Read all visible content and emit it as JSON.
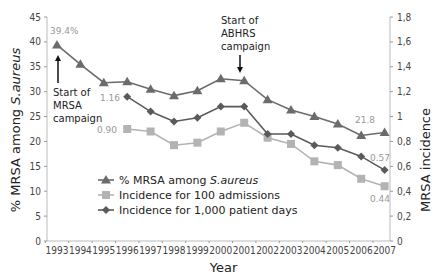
{
  "chart_data": {
    "type": "line",
    "title": "",
    "xlabel": "Year",
    "ylabel": "% MRSA among S.aureus",
    "y2label": "MRSA incidence",
    "x": [
      "1993",
      "1994",
      "1995",
      "1996",
      "1997",
      "1998",
      "1999",
      "2000",
      "2001",
      "2002",
      "2003",
      "2004",
      "2005",
      "2006",
      "2007"
    ],
    "ylim": [
      0,
      45
    ],
    "y2lim": [
      0,
      1.8
    ],
    "yticks": [
      "0",
      "5",
      "10",
      "15",
      "20",
      "25",
      "30",
      "35",
      "40",
      "45"
    ],
    "y2ticks": [
      "0",
      "0,2",
      "0,4",
      "0,6",
      "0,8",
      "1",
      "1,2",
      "1,4",
      "1,6",
      "1,8"
    ],
    "grid": false,
    "legend_position": "lower-center",
    "series": [
      {
        "name": "% MRSA among S.aureus",
        "axis": "left",
        "marker": "triangle",
        "color": "#6b6b6b",
        "values": [
          39.4,
          35.5,
          31.8,
          32.0,
          30.5,
          29.2,
          30.2,
          32.6,
          32.2,
          28.4,
          26.3,
          25.0,
          23.5,
          21.2,
          21.8
        ]
      },
      {
        "name": "Incidence for 100 admissions",
        "axis": "right",
        "marker": "square",
        "color": "#b3b3b3",
        "values": [
          null,
          null,
          null,
          0.9,
          0.88,
          0.77,
          0.79,
          0.88,
          0.95,
          0.83,
          0.78,
          0.64,
          0.61,
          0.5,
          0.44
        ]
      },
      {
        "name": "Incidence for 1,000 patient days",
        "axis": "right",
        "marker": "diamond",
        "color": "#5a5a5a",
        "values": [
          null,
          null,
          null,
          1.16,
          1.04,
          0.96,
          0.99,
          1.08,
          1.08,
          0.86,
          0.86,
          0.77,
          0.75,
          0.68,
          0.57
        ]
      }
    ],
    "annotations": [
      {
        "text": "Start of MRSA campaign",
        "x": "1993"
      },
      {
        "text": "Start of ABHRS campaign",
        "x": "2001"
      },
      {
        "text": "39.4%",
        "x": "1993",
        "series": 0
      },
      {
        "text": "21.8",
        "x": "2007",
        "series": 0
      },
      {
        "text": "1.16",
        "x": "1996",
        "series": 2
      },
      {
        "text": "0.57",
        "x": "2007",
        "series": 2
      },
      {
        "text": "0.90",
        "x": "1996",
        "series": 1
      },
      {
        "text": "0.44",
        "x": "2007",
        "series": 1
      }
    ]
  },
  "labels": {
    "xlabel": "Year",
    "ylabel": "% MRSA among S.aureus",
    "ylabel_plain": "% MRSA among ",
    "ylabel_italic": "S.aureus",
    "y2label": "MRSA incidence",
    "ann_mrsa": [
      "Start of",
      "MRSA",
      "campaign"
    ],
    "ann_abhrs": [
      "Start of",
      "ABHRS",
      "campaign"
    ],
    "legend": [
      {
        "plain": "% MRSA among ",
        "italic": "S.aureus"
      },
      {
        "plain": "Incidence for 100 admissions",
        "italic": ""
      },
      {
        "plain": "Incidence for 1,000 patient days",
        "italic": ""
      }
    ]
  }
}
